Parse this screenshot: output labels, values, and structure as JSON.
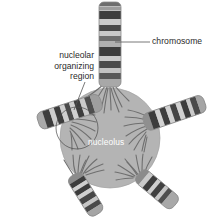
{
  "figure": {
    "name": "nucleolus-chromosome-diagram",
    "background_color": "#ffffff"
  },
  "labels": {
    "chromosome": "chromosome",
    "nucleolar_organizing_region_line1": "nucleolar",
    "nucleolar_organizing_region_line2": "organizing",
    "nucleolar_organizing_region_line3": "region",
    "nucleolus": "nucleolus"
  },
  "colors": {
    "nucleolus_fill": "#b4b4b4",
    "nucleolus_stroke": "#9a9a9a",
    "band_dark": "#3d3d3d",
    "band_mid": "#6e6e6e",
    "band_light": "#c6c6c6",
    "chromosome_base": "#a8a8a8",
    "fiber_stroke": "#7b7b7b",
    "leader_line": "#555555",
    "label_text": "#2b2b2b",
    "nucleolus_label_text": "#ffffff",
    "nor_circle_stroke": "#4a4a4a"
  },
  "structures": {
    "nucleolus": {
      "shape": "circle",
      "center_x": 110,
      "center_y": 138,
      "radius": 50
    },
    "nor_outline_circle": {
      "shape": "circle",
      "center_x": 77,
      "center_y": 128,
      "radius": 21
    },
    "chromosomes": [
      {
        "id": "chromosome-top",
        "position": "top",
        "angle_deg": 0,
        "banded": true
      },
      {
        "id": "chromosome-left",
        "position": "left",
        "angle_deg": -65,
        "banded": true
      },
      {
        "id": "chromosome-right",
        "position": "right",
        "angle_deg": 62,
        "banded": true
      },
      {
        "id": "chromosome-bottom-left",
        "position": "bottom-left",
        "angle_deg": 205,
        "banded": true
      },
      {
        "id": "chromosome-bottom-right",
        "position": "bottom-right",
        "angle_deg": 160,
        "banded": true
      }
    ],
    "leader_lines": [
      {
        "id": "leader-chromosome",
        "from_x": 115,
        "from_y": 42,
        "to_x": 150,
        "to_y": 42
      },
      {
        "id": "leader-nor",
        "from_x": 85,
        "from_y": 82,
        "to_x": 74,
        "to_y": 110
      }
    ]
  }
}
